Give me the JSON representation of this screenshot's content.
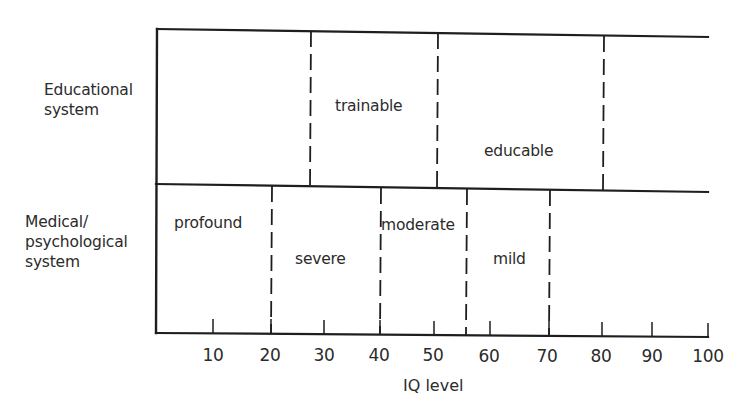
{
  "diagram": {
    "title": "",
    "rows": [
      {
        "id": "educational",
        "label": "Educational\nsystem",
        "categories": [
          {
            "label": "trainable",
            "iq_from": 27,
            "iq_to": 50
          },
          {
            "label": "educable",
            "iq_from": 50,
            "iq_to": 80
          }
        ],
        "dividers": [
          27,
          50,
          80
        ]
      },
      {
        "id": "medical",
        "label": "Medical/\npsychological\nsystem",
        "categories": [
          {
            "label": "profound",
            "iq_from": 0,
            "iq_to": 20
          },
          {
            "label": "severe",
            "iq_from": 20,
            "iq_to": 40
          },
          {
            "label": "moderate",
            "iq_from": 40,
            "iq_to": 55
          },
          {
            "label": "mild",
            "iq_from": 55,
            "iq_to": 70
          }
        ],
        "dividers": [
          20,
          40,
          55,
          70
        ]
      }
    ],
    "axis": {
      "title": "IQ level",
      "ticks": [
        "10",
        "20",
        "30",
        "40",
        "50",
        "60",
        "70",
        "80",
        "90",
        "100"
      ],
      "range": [
        0,
        100
      ]
    },
    "colors": {
      "line": "#1e1e1e",
      "text": "#2b2b2b",
      "background": "#ffffff"
    }
  }
}
